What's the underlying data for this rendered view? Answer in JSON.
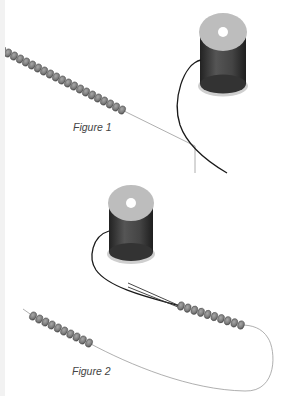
{
  "figures": [
    {
      "caption": "Figure 1",
      "caption_pos": [
        73,
        121
      ],
      "spool": {
        "cx": 223,
        "top_cy": 32,
        "bottom_cy": 84,
        "rx": 24,
        "ry": 19
      },
      "spool_thread": "M201,60 C183,64 172,100 180,125 C188,148 210,163 227,173",
      "bead_strand": {
        "start": [
          2,
          50
        ],
        "end": [
          122,
          110
        ],
        "count": 21
      },
      "tail_thread": "M122,110 L195,146 L195,173"
    },
    {
      "caption": "Figure 2",
      "caption_pos": [
        72,
        365
      ],
      "spool": {
        "cx": 131,
        "top_cy": 203,
        "bottom_cy": 252,
        "rx": 23,
        "ry": 18
      },
      "spool_thread": "M109,231 C92,236 88,258 96,270 C110,290 160,300 180,306",
      "needle_threads": [
        "M128,283 L180,306",
        "M128,287 L178,307"
      ],
      "bead_strand_right": {
        "start": [
          181,
          306
        ],
        "end": [
          241,
          325
        ],
        "count": 10
      },
      "bead_strand_left": {
        "start": [
          33,
          316
        ],
        "end": [
          89,
          343
        ],
        "count": 10
      },
      "loop_thread": "M23,309 L33,316 M89,343 C130,365 190,390 245,391 C278,392 276,350 268,338 C262,328 252,325 241,325"
    }
  ],
  "colors": {
    "bead": "#7d7d7d",
    "bead_edge": "#4a4a4a",
    "thread_dark": "#1a1a1a",
    "thread_light": "#9a9a9a",
    "spool_top": "#bdbdbd",
    "spool_body": "#3a3a3a"
  }
}
